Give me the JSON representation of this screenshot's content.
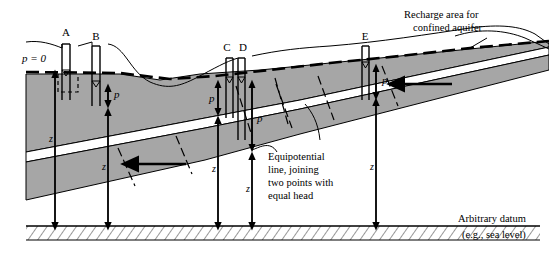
{
  "figure": {
    "type": "hydrogeologic-cross-section",
    "title": "",
    "colors": {
      "confining_unit": "#a6a6a6",
      "aquifer": "#ffffff",
      "outline": "#000000",
      "water_table": "#000000",
      "datum_hatch": "#000000"
    }
  },
  "wells": [
    {
      "id": "A",
      "label": "A",
      "pressure_label": "",
      "depth_label": "z",
      "note": "water table well, p = 0"
    },
    {
      "id": "B",
      "label": "B",
      "pressure_label": "p",
      "depth_label": "z",
      "note": "shallow well with pressure head"
    },
    {
      "id": "C",
      "label": "C",
      "pressure_label": "p",
      "depth_label": "z",
      "note": "well screened above aquifer"
    },
    {
      "id": "D",
      "label": "D",
      "pressure_label": "p",
      "depth_label": "z",
      "note": "deep well screened in confined aquifer"
    },
    {
      "id": "E",
      "label": "E",
      "pressure_label": "p",
      "depth_label": "z",
      "note": "well in confined aquifer near recharge"
    }
  ],
  "annotations": {
    "pressure_zero": "p = 0",
    "recharge": "Recharge area for\nconfined aquifer",
    "recharge_line1": "Recharge area for",
    "recharge_line2": "confined aquifer",
    "equipotential_line1": "Equipotential",
    "equipotential_line2": "line, joining",
    "equipotential_line3": "two points with",
    "equipotential_line4": "equal head",
    "datum": "Arbitrary datum",
    "datum_sub": "(e.g., sea level)"
  },
  "symbols": {
    "water_table_marker": "water-table-triangle-icon",
    "flow_arrow": "flow-direction-arrow-icon",
    "head_arrow": "head-measure-arrow-icon"
  },
  "pressure_labels": {
    "p": "p",
    "z": "z"
  }
}
